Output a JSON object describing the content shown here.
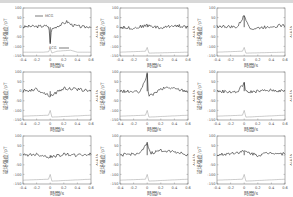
{
  "chart_data": [
    {
      "type": "line",
      "panel": 1,
      "title": "",
      "xlabel": "時間/s",
      "ylabel": "磁场强度/pT",
      "y2label": "V/mV",
      "xlim": [
        -0.4,
        0.6
      ],
      "ylim": [
        -150,
        100
      ],
      "xticks": [
        "-0.4",
        "-0.2",
        "0",
        "0.2",
        "0.4",
        "0.6"
      ],
      "yticks": [
        "100",
        "50",
        "0",
        "-50",
        "-100",
        "-150"
      ],
      "legend": [
        {
          "name": "MCG",
          "color": "#222222"
        },
        {
          "name": "ECG",
          "color": "#888888"
        }
      ],
      "series": [
        {
          "name": "MCG",
          "x": [
            -0.4,
            -0.3,
            -0.2,
            -0.1,
            -0.02,
            0,
            0.02,
            0.1,
            0.2,
            0.25,
            0.3,
            0.4,
            0.5,
            0.6
          ],
          "values": [
            0,
            5,
            3,
            6,
            5,
            -80,
            -10,
            5,
            20,
            30,
            15,
            5,
            0,
            5
          ]
        },
        {
          "name": "ECG",
          "x": [
            -0.4,
            -0.1,
            -0.02,
            0,
            0.02,
            0.1,
            0.3,
            0.4,
            0.6
          ],
          "values": [
            -130,
            -130,
            -128,
            -110,
            -135,
            -125,
            -120,
            -130,
            -130
          ]
        }
      ]
    },
    {
      "type": "line",
      "panel": 2,
      "xlabel": "時間/s",
      "ylabel": "磁场强度/pT",
      "y2label": "V/mV",
      "xlim": [
        -0.4,
        0.6
      ],
      "ylim": [
        -150,
        100
      ],
      "series": [
        {
          "name": "MCG",
          "x": [
            -0.4,
            -0.2,
            0,
            0.2,
            0.4,
            0.6
          ],
          "values": [
            0,
            -5,
            10,
            -5,
            10,
            0
          ]
        },
        {
          "name": "ECG",
          "x": [
            -0.4,
            -0.02,
            0,
            0.02,
            0.6
          ],
          "values": [
            -130,
            -125,
            -105,
            -135,
            -130
          ]
        }
      ]
    },
    {
      "type": "line",
      "panel": 3,
      "xlabel": "時間/s",
      "ylabel": "磁场强度/pT",
      "y2label": "V/mV",
      "xlim": [
        -0.4,
        0.6
      ],
      "ylim": [
        -150,
        100
      ],
      "series": [
        {
          "name": "MCG",
          "x": [
            -0.4,
            -0.1,
            0,
            0.1,
            0.4,
            0.6
          ],
          "values": [
            5,
            0,
            60,
            -10,
            5,
            10
          ]
        },
        {
          "name": "ECG",
          "x": [
            -0.4,
            -0.02,
            0,
            0.02,
            0.6
          ],
          "values": [
            -130,
            -125,
            -105,
            -135,
            -130
          ]
        }
      ]
    },
    {
      "type": "line",
      "panel": 4,
      "xlabel": "時間/s",
      "ylabel": "磁场强度/pT",
      "y2label": "V/mV",
      "xlim": [
        -0.4,
        0.6
      ],
      "ylim": [
        -150,
        100
      ],
      "series": [
        {
          "name": "MCG",
          "x": [
            -0.4,
            -0.2,
            0,
            0.2,
            0.4,
            0.6
          ],
          "values": [
            0,
            10,
            -25,
            15,
            10,
            0
          ]
        },
        {
          "name": "ECG",
          "x": [
            -0.4,
            -0.02,
            0,
            0.02,
            0.6
          ],
          "values": [
            -130,
            -125,
            -100,
            -135,
            -125
          ]
        }
      ]
    },
    {
      "type": "line",
      "panel": 5,
      "xlabel": "時間/s",
      "ylabel": "磁场强度/pT",
      "y2label": "V/mV",
      "xlim": [
        -0.4,
        0.6
      ],
      "ylim": [
        -150,
        100
      ],
      "series": [
        {
          "name": "MCG",
          "x": [
            -0.4,
            -0.1,
            0,
            0.02,
            0.2,
            0.3,
            0.6
          ],
          "values": [
            0,
            -5,
            90,
            -30,
            10,
            20,
            0
          ]
        },
        {
          "name": "ECG",
          "x": [
            -0.4,
            -0.02,
            0,
            0.02,
            0.6
          ],
          "values": [
            -130,
            -125,
            -100,
            -135,
            -125
          ]
        }
      ]
    },
    {
      "type": "line",
      "panel": 6,
      "xlabel": "時間/s",
      "ylabel": "磁场强度/pT",
      "y2label": "V/mV",
      "xlim": [
        -0.4,
        0.6
      ],
      "ylim": [
        -150,
        100
      ],
      "series": [
        {
          "name": "MCG",
          "x": [
            -0.4,
            -0.1,
            0,
            0.02,
            0.4,
            0.6
          ],
          "values": [
            0,
            -5,
            45,
            -5,
            5,
            0
          ]
        },
        {
          "name": "ECG",
          "x": [
            -0.4,
            -0.02,
            0,
            0.02,
            0.6
          ],
          "values": [
            -130,
            -125,
            -100,
            -135,
            -125
          ]
        }
      ]
    },
    {
      "type": "line",
      "panel": 7,
      "xlabel": "時間/s",
      "ylabel": "磁场强度/pT",
      "y2label": "V/mV",
      "xlim": [
        -0.4,
        0.6
      ],
      "ylim": [
        -150,
        100
      ],
      "series": [
        {
          "name": "MCG",
          "x": [
            -0.4,
            -0.2,
            0,
            0.2,
            0.4,
            0.6
          ],
          "values": [
            0,
            5,
            -10,
            5,
            0,
            5
          ]
        },
        {
          "name": "ECG",
          "x": [
            -0.4,
            -0.02,
            0,
            0.02,
            0.6
          ],
          "values": [
            -130,
            -125,
            -100,
            -135,
            -125
          ]
        }
      ]
    },
    {
      "type": "line",
      "panel": 8,
      "xlabel": "時間/s",
      "ylabel": "磁场强度/pT",
      "y2label": "V/mV",
      "xlim": [
        -0.4,
        0.6
      ],
      "ylim": [
        -150,
        100
      ],
      "series": [
        {
          "name": "MCG",
          "x": [
            -0.4,
            -0.1,
            0,
            0.05,
            0.2,
            0.4,
            0.6
          ],
          "values": [
            0,
            10,
            60,
            10,
            25,
            20,
            0
          ]
        },
        {
          "name": "ECG",
          "x": [
            -0.4,
            -0.02,
            0,
            0.02,
            0.6
          ],
          "values": [
            -130,
            -125,
            -100,
            -135,
            -125
          ]
        }
      ]
    },
    {
      "type": "line",
      "panel": 9,
      "xlabel": "時間/s",
      "ylabel": "磁场强度/pT",
      "y2label": "V/mV",
      "xlim": [
        -0.4,
        0.6
      ],
      "ylim": [
        -150,
        100
      ],
      "series": [
        {
          "name": "MCG",
          "x": [
            -0.4,
            -0.2,
            0,
            0.2,
            0.4,
            0.6
          ],
          "values": [
            0,
            10,
            20,
            0,
            15,
            5
          ]
        },
        {
          "name": "ECG",
          "x": [
            -0.4,
            -0.02,
            0,
            0.02,
            0.6
          ],
          "values": [
            -130,
            -125,
            -100,
            -135,
            -125
          ]
        }
      ]
    }
  ],
  "labels": {
    "xlabel": "時間/s",
    "ylabel": "磁场强度/pT",
    "y2label": "V/mV",
    "mcg": "MCG",
    "ecg": "ECG"
  },
  "xticks": [
    "-0.4",
    "-0.2",
    "0",
    "0.2",
    "0.4",
    "0.6"
  ],
  "yticks": [
    "100",
    "50",
    "0",
    "-50",
    "-100",
    "-150"
  ]
}
